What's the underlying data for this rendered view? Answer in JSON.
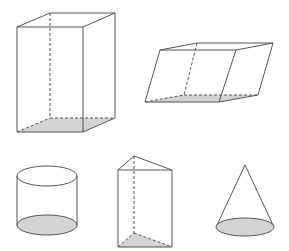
{
  "diagram": {
    "title": "",
    "shapes": [
      {
        "id": "rectangular-prism",
        "label": "Rectangular prism (cuboid)"
      },
      {
        "id": "oblique-parallelepiped",
        "label": "Oblique parallelepiped"
      },
      {
        "id": "cylinder",
        "label": "Cylinder"
      },
      {
        "id": "triangular-prism",
        "label": "Triangular prism"
      },
      {
        "id": "cone",
        "label": "Cone"
      }
    ],
    "colors": {
      "edge": "#555555",
      "base_shade": "#d4d4d4",
      "background": "#ffffff"
    }
  }
}
